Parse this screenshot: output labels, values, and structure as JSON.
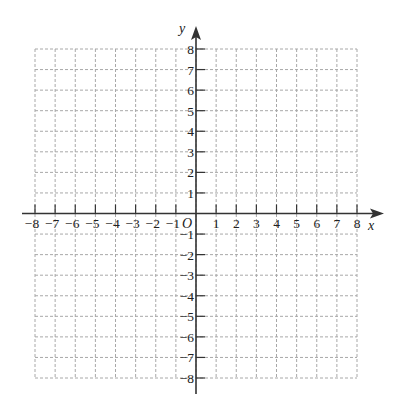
{
  "chart_data": {
    "type": "coordinate-grid",
    "title": "",
    "xlabel": "x",
    "ylabel": "y",
    "origin_label": "O",
    "xlim": [
      -8,
      8
    ],
    "ylim": [
      -8,
      8
    ],
    "grid": true,
    "grid_style": "dashed",
    "grid_step": 1,
    "x_ticks": [
      -8,
      -7,
      -6,
      -5,
      -4,
      -3,
      -2,
      -1,
      1,
      2,
      3,
      4,
      5,
      6,
      7,
      8
    ],
    "y_ticks": [
      8,
      7,
      6,
      5,
      4,
      3,
      2,
      1,
      -1,
      -2,
      -3,
      -4,
      -5,
      -6,
      -7,
      -8
    ],
    "data_points": []
  },
  "axes": {
    "x_label": "x",
    "y_label": "y",
    "origin": "O"
  },
  "colors": {
    "grid": "#a8a8a8",
    "axis": "#333333",
    "text": "#222222",
    "background": "#ffffff"
  }
}
